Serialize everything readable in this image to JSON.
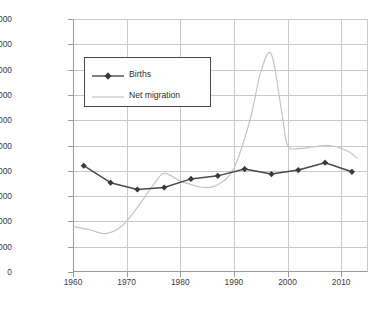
{
  "chart_data": {
    "type": "line",
    "title": "",
    "xlabel": "",
    "ylabel": "",
    "xlim": [
      1960,
      2015
    ],
    "ylim": [
      0,
      10000000
    ],
    "grid": true,
    "legend_position": "inside-top-left",
    "y_ticks": [
      0,
      1000000,
      2000000,
      3000000,
      4000000,
      5000000,
      6000000,
      7000000,
      8000000,
      9000000,
      10000000
    ],
    "y_tick_labels": [
      "0",
      "1,000,000",
      "2,000,000",
      "3,000,000",
      "4,000,000",
      "5,000,000",
      "6,000,000",
      "7,000,000",
      "8,000,000",
      "9,000,000",
      "10,000,000"
    ],
    "x_ticks": [
      1960,
      1970,
      1980,
      1990,
      2000,
      2010
    ],
    "x_tick_labels": [
      "1960",
      "1970",
      "1980",
      "1990",
      "2000",
      "2010"
    ],
    "series": [
      {
        "name": "Births",
        "color": "#4a4a4a",
        "marker": "diamond",
        "x": [
          1962,
          1967,
          1972,
          1977,
          1982,
          1987,
          1992,
          1997,
          2002,
          2007,
          2012
        ],
        "values": [
          4200000,
          3530000,
          3260000,
          3340000,
          3680000,
          3800000,
          4070000,
          3870000,
          4030000,
          4320000,
          3960000
        ]
      },
      {
        "name": "Net migration",
        "color": "#c4c4c4",
        "marker": "none",
        "x": [
          1960,
          1963,
          1966,
          1969,
          1972,
          1975,
          1977,
          1980,
          1984,
          1987,
          1990,
          1993,
          1995,
          1997,
          1999,
          2000,
          2002,
          2005,
          2008,
          2011,
          2013
        ],
        "values": [
          1800000,
          1680000,
          1520000,
          1800000,
          2550000,
          3450000,
          3900000,
          3600000,
          3350000,
          3450000,
          4100000,
          6000000,
          7900000,
          8600000,
          6200000,
          5000000,
          4880000,
          4950000,
          5000000,
          4800000,
          4500000
        ]
      }
    ]
  },
  "legend": {
    "items": [
      {
        "label": "Births",
        "color": "#4a4a4a"
      },
      {
        "label": "Net migration",
        "color": "#c4c4c4"
      }
    ]
  }
}
